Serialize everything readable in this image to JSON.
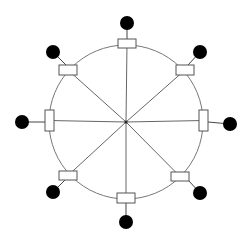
{
  "diagram": {
    "type": "ring-star-topology",
    "width": 248,
    "height": 240,
    "center": {
      "x": 126,
      "y": 122
    },
    "ring_radius": 77,
    "colors": {
      "background": "#ffffff",
      "ring": "#777777",
      "spoke": "#666666",
      "box_fill": "#ffffff",
      "box_stroke": "#555555",
      "dot": "#000000"
    },
    "nodes": [
      {
        "id": "top",
        "box": {
          "x": 118,
          "y": 39,
          "w": 18,
          "h": 9
        },
        "dot": {
          "cx": 127,
          "cy": 23,
          "r": 7
        },
        "stub_from": {
          "x": 127,
          "y": 39
        }
      },
      {
        "id": "top-right",
        "box": {
          "x": 176,
          "y": 65,
          "w": 18,
          "h": 10
        },
        "dot": {
          "cx": 200,
          "cy": 52,
          "r": 7
        },
        "stub_from": {
          "x": 188,
          "y": 65
        }
      },
      {
        "id": "right",
        "box": {
          "x": 199,
          "y": 110,
          "w": 9,
          "h": 21
        },
        "dot": {
          "cx": 230,
          "cy": 124,
          "r": 7
        },
        "stub_from": {
          "x": 208,
          "y": 122
        }
      },
      {
        "id": "bottom-right",
        "box": {
          "x": 171,
          "y": 172,
          "w": 18,
          "h": 9
        },
        "dot": {
          "cx": 200,
          "cy": 193,
          "r": 7
        },
        "stub_from": {
          "x": 189,
          "y": 181
        }
      },
      {
        "id": "bottom",
        "box": {
          "x": 117,
          "y": 193,
          "w": 18,
          "h": 10
        },
        "dot": {
          "cx": 126,
          "cy": 222,
          "r": 7
        },
        "stub_from": {
          "x": 126,
          "y": 203
        }
      },
      {
        "id": "bottom-left",
        "box": {
          "x": 59,
          "y": 171,
          "w": 18,
          "h": 9
        },
        "dot": {
          "cx": 53,
          "cy": 192,
          "r": 7
        },
        "stub_from": {
          "x": 65,
          "y": 180
        }
      },
      {
        "id": "left",
        "box": {
          "x": 45,
          "y": 110,
          "w": 9,
          "h": 21
        },
        "dot": {
          "cx": 22,
          "cy": 122,
          "r": 7
        },
        "stub_from": {
          "x": 45,
          "y": 122
        }
      },
      {
        "id": "top-left",
        "box": {
          "x": 59,
          "y": 65,
          "w": 18,
          "h": 10
        },
        "dot": {
          "cx": 53,
          "cy": 52,
          "r": 7
        },
        "stub_from": {
          "x": 66,
          "y": 65
        }
      }
    ]
  }
}
